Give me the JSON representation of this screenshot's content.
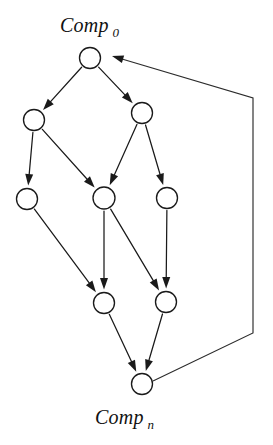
{
  "diagram": {
    "type": "directed-graph",
    "title": "",
    "background_color": "#ffffff",
    "stroke_color": "#1a1a1a",
    "node_fill": "#ffffff",
    "labels": {
      "top": {
        "base": "Comp",
        "subscript": "0",
        "x": 60,
        "y": 32
      },
      "bottom": {
        "base": "Comp",
        "subscript": "n",
        "x": 95,
        "y": 424
      }
    },
    "nodes": [
      {
        "id": "n0",
        "name": "node-comp-0",
        "cx": 90,
        "cy": 58,
        "r": 10.5,
        "level": 0
      },
      {
        "id": "n1",
        "name": "node-l1-left",
        "cx": 34,
        "cy": 120,
        "r": 10.5,
        "level": 1
      },
      {
        "id": "n2",
        "name": "node-l1-right",
        "cx": 142,
        "cy": 113,
        "r": 10.5,
        "level": 1
      },
      {
        "id": "n3",
        "name": "node-l2-left",
        "cx": 27,
        "cy": 199,
        "r": 10.5,
        "level": 2
      },
      {
        "id": "n4",
        "name": "node-l2-mid",
        "cx": 104,
        "cy": 198,
        "r": 11.0,
        "level": 2
      },
      {
        "id": "n5",
        "name": "node-l2-right",
        "cx": 167,
        "cy": 198,
        "r": 10.5,
        "level": 2
      },
      {
        "id": "n6",
        "name": "node-l3-left",
        "cx": 104,
        "cy": 303,
        "r": 10.5,
        "level": 3
      },
      {
        "id": "n7",
        "name": "node-l3-right",
        "cx": 166,
        "cy": 302,
        "r": 10.5,
        "level": 3
      },
      {
        "id": "n8",
        "name": "node-comp-n",
        "cx": 142,
        "cy": 384,
        "r": 10.5,
        "level": 4
      }
    ],
    "edges": [
      {
        "name": "edge-n0-n1",
        "from": "n0",
        "to": "n1",
        "arrow": true
      },
      {
        "name": "edge-n0-n2",
        "from": "n0",
        "to": "n2",
        "arrow": true
      },
      {
        "name": "edge-n1-n3",
        "from": "n1",
        "to": "n3",
        "arrow": true
      },
      {
        "name": "edge-n1-n4",
        "from": "n1",
        "to": "n4",
        "arrow": true
      },
      {
        "name": "edge-n2-n4",
        "from": "n2",
        "to": "n4",
        "arrow": true
      },
      {
        "name": "edge-n2-n5",
        "from": "n2",
        "to": "n5",
        "arrow": true
      },
      {
        "name": "edge-n3-n6",
        "from": "n3",
        "to": "n6",
        "arrow": true
      },
      {
        "name": "edge-n4-n6",
        "from": "n4",
        "to": "n6",
        "arrow": true
      },
      {
        "name": "edge-n4-n7",
        "from": "n4",
        "to": "n7",
        "arrow": true
      },
      {
        "name": "edge-n5-n7",
        "from": "n5",
        "to": "n7",
        "arrow": true
      },
      {
        "name": "edge-n6-n8",
        "from": "n6",
        "to": "n8",
        "arrow": true
      },
      {
        "name": "edge-n7-n8",
        "from": "n7",
        "to": "n8",
        "arrow": true
      }
    ],
    "feedback_edge": {
      "name": "edge-feedback-n8-n0",
      "from": "n8",
      "to": "n0",
      "points": [
        [
          153,
          381
        ],
        [
          253,
          333
        ],
        [
          253,
          98
        ],
        [
          112,
          56
        ]
      ],
      "arrow": true,
      "arrow_direction": "left"
    }
  }
}
